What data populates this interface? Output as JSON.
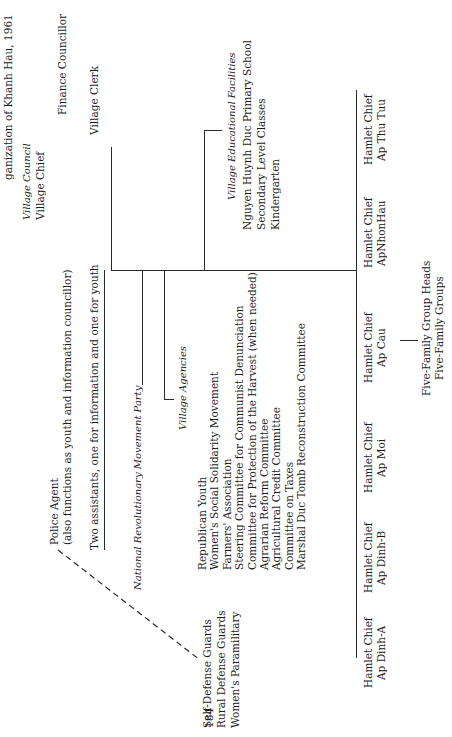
{
  "page": {
    "title_fragment": "ganization of Khanh Hau, 1961",
    "page_number": "184"
  },
  "village_council": {
    "heading": "Village Council",
    "chief": "Village Chief",
    "finance": "Finance Councillor",
    "clerk": "Village Clerk"
  },
  "police": {
    "title": "Police Agent",
    "note": "(also functions as youth and information councillor)"
  },
  "assistants": "Two assistants, one for information and one for youth",
  "party": "National Revolutionary Movement Party",
  "paramilitary": [
    "Self-Defense Guards",
    "Rural Defense Guards",
    "Women's Paramilitary"
  ],
  "agencies": {
    "heading": "Village Agencies",
    "items": [
      "Republican Youth",
      "Women's Social Solidarity Movement",
      "Farmers' Association",
      "Steering Committee for Communist Denunciation",
      "Committee for Protection of the Harvest (when needed)",
      "Agrarian Reform Committee",
      "Agricultural Credit Committee",
      "Committee on Taxes",
      "Marshal Duc Tomb Reconstruction Committee"
    ]
  },
  "education": {
    "heading": "Village Educational Facilities",
    "items": [
      "Nguyen Huynh Duc Primary School",
      "Secondary Level Classes",
      "Kindergarten"
    ]
  },
  "hamlets": [
    {
      "title": "Hamlet Chief",
      "name": "Ap Dinh-A"
    },
    {
      "title": "Hamlet Chief",
      "name": "Ap Dinh-B"
    },
    {
      "title": "Hamlet Chief",
      "name": "Ap Moi"
    },
    {
      "title": "Hamlet Chief",
      "name": "Ap Cau"
    },
    {
      "title": "Hamlet Chief",
      "name": "ApNhonHau"
    },
    {
      "title": "Hamlet Chief",
      "name": "Ap Thu Tuu"
    }
  ],
  "five_family": {
    "heads": "Five-Family Group Heads",
    "groups": "Five-Family Groups"
  }
}
